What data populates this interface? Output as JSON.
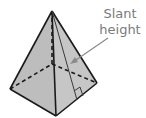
{
  "diagram": {
    "shape": "square pyramid",
    "label": {
      "line1": "Slant",
      "line2": "height"
    },
    "colors": {
      "face_fill": "#bdbdbd",
      "edge": "#1a1a1a",
      "label_text": "#7a7a7a",
      "arrow": "#8a8a8a"
    },
    "vertices": {
      "apex": [
        52,
        11
      ],
      "left": [
        10,
        89
      ],
      "front": [
        56,
        116
      ],
      "right": [
        97,
        83
      ],
      "back_hidden": [
        52,
        64
      ]
    },
    "slant_height_foot": [
      77,
      100
    ]
  }
}
